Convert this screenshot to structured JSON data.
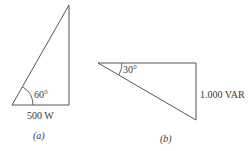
{
  "figure": {
    "colors": {
      "stroke": "#555555",
      "text": "#3a3a3a",
      "background": "#ffffff"
    },
    "panels": [
      {
        "id": "a",
        "caption": "(a)",
        "shape": "right-triangle",
        "angle_label": "60°",
        "base_label": "500 W"
      },
      {
        "id": "b",
        "caption": "(b)",
        "shape": "right-triangle",
        "angle_label": "30°",
        "side_label": "1.000 VAR"
      }
    ]
  }
}
